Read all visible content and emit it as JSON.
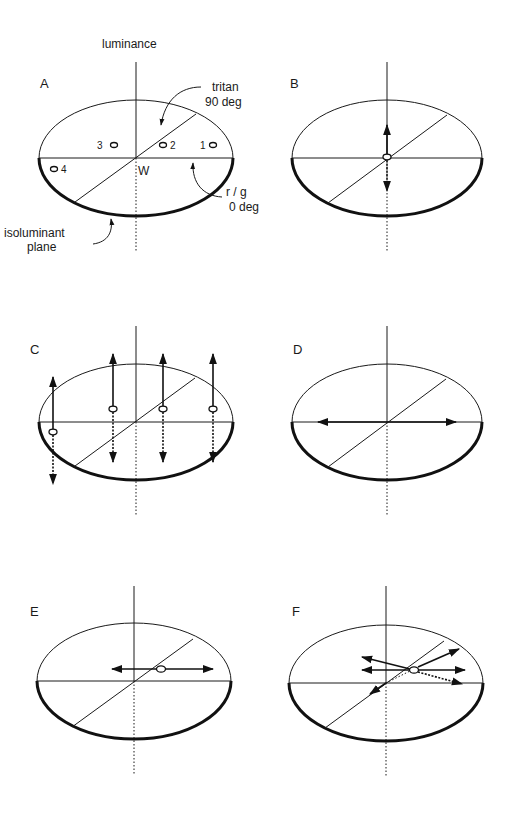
{
  "figure": {
    "colors": {
      "ink": "#1a1a1a",
      "background": "#ffffff"
    },
    "axis_title": "luminance",
    "panels": [
      {
        "id": "A",
        "label": "A",
        "center": [
          136,
          158
        ],
        "rx": 97,
        "ry": 58,
        "axis_top": 62,
        "dotted_bottom": 252,
        "origin_label": "W",
        "annotations": {
          "tritan": [
            "tritan",
            "90 deg"
          ],
          "rg": [
            "r / g",
            "0 deg"
          ],
          "plane": [
            "isoluminant",
            "plane"
          ]
        },
        "points": [
          {
            "label": "1",
            "x": 213,
            "y": 145
          },
          {
            "label": "2",
            "x": 163,
            "y": 145
          },
          {
            "label": "3",
            "x": 114,
            "y": 145
          },
          {
            "label": "4",
            "x": 55,
            "y": 169
          }
        ]
      },
      {
        "id": "B",
        "label": "B",
        "center": [
          387,
          158
        ],
        "rx": 95,
        "ry": 58,
        "axis_top": 62,
        "dotted_bottom": 252,
        "description": "stimulus at white point modulated along luminance axis"
      },
      {
        "id": "C",
        "label": "C",
        "center": [
          136,
          422
        ],
        "rx": 97,
        "ry": 58,
        "axis_top": 326,
        "dotted_bottom": 515,
        "points": [
          {
            "x": 53,
            "y": 432
          },
          {
            "x": 113,
            "y": 409
          },
          {
            "x": 163,
            "y": 409
          },
          {
            "x": 213,
            "y": 409
          }
        ],
        "description": "chromatic points modulated in luminance"
      },
      {
        "id": "D",
        "label": "D",
        "center": [
          387,
          422
        ],
        "rx": 95,
        "ry": 58,
        "axis_top": 326,
        "dotted_bottom": 515,
        "description": "isoluminant modulation along r/g axis through white"
      },
      {
        "id": "E",
        "label": "E",
        "center": [
          134,
          681
        ],
        "rx": 97,
        "ry": 58,
        "axis_top": 586,
        "dotted_bottom": 775,
        "point": {
          "x": 161,
          "y": 669
        },
        "description": "r/g modulation about an off-white point"
      },
      {
        "id": "F",
        "label": "F",
        "center": [
          386,
          683
        ],
        "rx": 97,
        "ry": 58,
        "axis_top": 586,
        "dotted_bottom": 777,
        "point": {
          "x": 414,
          "y": 670
        },
        "description": "modulations in several directions about an off-white point"
      }
    ]
  }
}
